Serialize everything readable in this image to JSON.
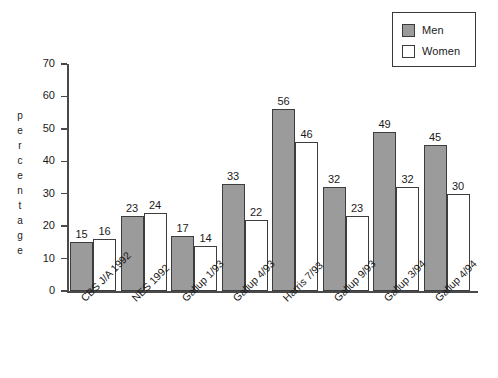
{
  "chart_data": {
    "type": "bar",
    "title": "",
    "subtitle": "",
    "xlabel": "",
    "ylabel": "percentage",
    "ylim": [
      0,
      70
    ],
    "ytick_step": 10,
    "yticks": [
      70,
      60,
      50,
      40,
      30,
      20,
      10,
      0
    ],
    "grid": false,
    "legend_position": "top-right",
    "categories": [
      "CBS J/A 1992",
      "NES 1992",
      "Gallup 1/93",
      "Gallup 4/93",
      "Harris 7/93",
      "Gallup 9/93",
      "Gallup 3/94",
      "Gallup 4/94"
    ],
    "series": [
      {
        "name": "Men",
        "color": "#9b9b9b",
        "values": [
          15,
          23,
          17,
          33,
          56,
          32,
          49,
          45
        ]
      },
      {
        "name": "Women",
        "color": "#ffffff",
        "values": [
          16,
          24,
          14,
          22,
          46,
          23,
          32,
          30
        ]
      }
    ]
  },
  "legend": {
    "items": [
      {
        "label": "Men",
        "swatch": "men-swatch"
      },
      {
        "label": "Women",
        "swatch": "women-swatch"
      }
    ]
  },
  "axis": {
    "y_title_letters": [
      "p",
      "e",
      "r",
      "c",
      "e",
      "n",
      "t",
      "a",
      "g",
      "e"
    ]
  },
  "colors": {
    "men_fill": "#9b9b9b",
    "women_fill": "#ffffff",
    "bar_border": "#3d3d3d",
    "axis": "#4a4a4a",
    "text": "#1a1a1a",
    "background": "#ffffff"
  }
}
